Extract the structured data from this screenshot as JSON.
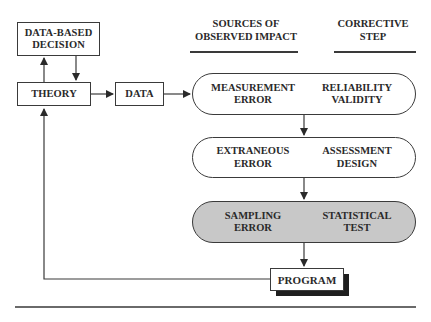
{
  "headers": {
    "sources": [
      "SOURCES OF",
      "OBSERVED IMPACT"
    ],
    "corrective": [
      "CORRECTIVE",
      "STEP"
    ]
  },
  "boxes": {
    "decision": [
      "DATA-BASED",
      "DECISION"
    ],
    "theory": "THEORY",
    "data": "DATA",
    "program": "PROGRAM"
  },
  "stages": [
    {
      "source": [
        "MEASUREMENT",
        "ERROR"
      ],
      "step": [
        "RELIABILITY",
        "VALIDITY"
      ],
      "shaded": false
    },
    {
      "source": [
        "EXTRANEOUS",
        "ERROR"
      ],
      "step": [
        "ASSESSMENT",
        "DESIGN"
      ],
      "shaded": false
    },
    {
      "source": [
        "SAMPLING",
        "ERROR"
      ],
      "step": [
        "STATISTICAL",
        "TEST"
      ],
      "shaded": true
    }
  ],
  "colors": {
    "line": "#3a3a3a",
    "shaded_fill": "#c8c8c8",
    "shadow": "#1f1f1f"
  }
}
